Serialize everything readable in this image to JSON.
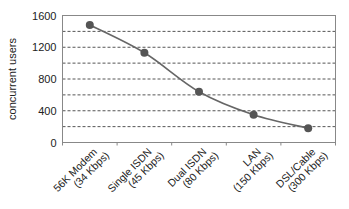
{
  "chart_data": {
    "type": "line",
    "title": "",
    "xlabel": "",
    "ylabel": "concurrent users",
    "ylim": [
      0,
      1600
    ],
    "yticks": [
      0,
      400,
      800,
      1200,
      1600
    ],
    "grid": {
      "horizontal": true,
      "style": "dashed",
      "step": 200
    },
    "legend": null,
    "categories": [
      [
        "56K Modem",
        "(34 Kbps)"
      ],
      [
        "Single ISDN",
        "(45 Kbps)"
      ],
      [
        "Dual ISDN",
        "(80 Kbps)"
      ],
      [
        "LAN",
        "(150 Kbps)"
      ],
      [
        "DSL/Cable",
        "(300 Kbps)"
      ]
    ],
    "series": [
      {
        "name": "concurrent users",
        "values": [
          1480,
          1130,
          640,
          350,
          180
        ],
        "color": "#666666"
      }
    ]
  }
}
